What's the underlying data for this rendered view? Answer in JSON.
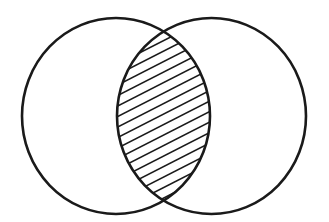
{
  "diagram": {
    "type": "venn",
    "sets": [
      {
        "name": "set-a",
        "cx": 116,
        "cy": 116,
        "rx": 94,
        "ry": 98
      },
      {
        "name": "set-b",
        "cx": 211.5,
        "cy": 116,
        "rx": 94.5,
        "ry": 98
      }
    ],
    "shaded_region": "intersection",
    "fill_pattern": "diagonal-hatch",
    "hatch": {
      "angle_deg": -27,
      "spacing": 10.5,
      "stroke_width": 1.6
    },
    "outline_stroke_width": 2.6,
    "colors": {
      "background": "#ffffff",
      "stroke": "#1a1a1a",
      "hatch": "#1a1a1a"
    }
  }
}
